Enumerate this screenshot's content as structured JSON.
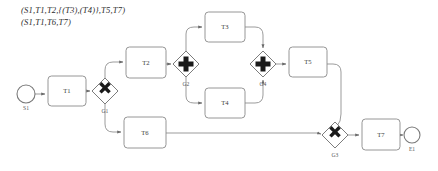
{
  "diagram": {
    "type": "bpmn-process-model",
    "traces": {
      "label": "execution-traces",
      "lines": [
        "(S1,T1,T2,{(T3),(T4)},T5,T7)",
        "(S1,T1,T6,T7)"
      ]
    },
    "events": [
      {
        "id": "S1",
        "label": "S1",
        "kind": "start-event",
        "x": 26,
        "y": 94,
        "r": 9
      },
      {
        "id": "E1",
        "label": "E1",
        "kind": "end-event",
        "x": 412,
        "y": 135,
        "r": 8
      }
    ],
    "tasks": [
      {
        "id": "T1",
        "label": "T1",
        "x": 48,
        "y": 76,
        "w": 38,
        "h": 30
      },
      {
        "id": "T2",
        "label": "T2",
        "x": 126,
        "y": 47,
        "w": 40,
        "h": 31
      },
      {
        "id": "T3",
        "label": "T3",
        "x": 205,
        "y": 12,
        "w": 40,
        "h": 30
      },
      {
        "id": "T4",
        "label": "T4",
        "x": 205,
        "y": 88,
        "w": 40,
        "h": 30
      },
      {
        "id": "T5",
        "label": "T5",
        "x": 289,
        "y": 47,
        "w": 38,
        "h": 30
      },
      {
        "id": "T6",
        "label": "T6",
        "x": 124,
        "y": 117,
        "w": 42,
        "h": 31
      },
      {
        "id": "T7",
        "label": "T7",
        "x": 362,
        "y": 119,
        "w": 38,
        "h": 31
      }
    ],
    "gateways": [
      {
        "id": "G1",
        "label": "G1",
        "kind": "exclusive-gateway",
        "glyph": "x",
        "cx": 105,
        "cy": 91,
        "half": 13
      },
      {
        "id": "G2",
        "label": "G2",
        "kind": "parallel-gateway",
        "glyph": "plus",
        "cx": 186,
        "cy": 64,
        "half": 13
      },
      {
        "id": "G4",
        "label": "G4",
        "kind": "parallel-gateway",
        "glyph": "plus",
        "cx": 263,
        "cy": 64,
        "half": 13
      },
      {
        "id": "G3",
        "label": "G3",
        "kind": "exclusive-gateway",
        "glyph": "x",
        "cx": 335,
        "cy": 135,
        "half": 13
      }
    ],
    "flows": [
      {
        "from": "S1",
        "to": "T1"
      },
      {
        "from": "T1",
        "to": "G1"
      },
      {
        "from": "G1",
        "to": "T2"
      },
      {
        "from": "G1",
        "to": "T6"
      },
      {
        "from": "T2",
        "to": "G2"
      },
      {
        "from": "G2",
        "to": "T3"
      },
      {
        "from": "G2",
        "to": "T4"
      },
      {
        "from": "T3",
        "to": "G4"
      },
      {
        "from": "T4",
        "to": "G4"
      },
      {
        "from": "G4",
        "to": "T5"
      },
      {
        "from": "T5",
        "to": "G3"
      },
      {
        "from": "T6",
        "to": "G3"
      },
      {
        "from": "G3",
        "to": "T7"
      },
      {
        "from": "T7",
        "to": "E1"
      }
    ],
    "colors": {
      "stroke": "#8a8a8a",
      "glyph": "#1a1a1a",
      "text": "#3a3a3a",
      "background": "#ffffff"
    }
  }
}
